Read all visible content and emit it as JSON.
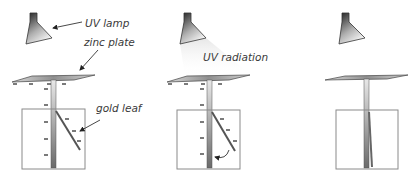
{
  "diagram": {
    "panels": [
      {
        "id": "panel-1",
        "state": "charged",
        "labels": {
          "lamp": "UV lamp",
          "plate": "zinc plate",
          "leaf": "gold leaf"
        },
        "charge_symbol": "-"
      },
      {
        "id": "panel-2",
        "state": "discharging",
        "labels": {
          "radiation": "UV radiation"
        },
        "charge_symbol": "-"
      },
      {
        "id": "panel-3",
        "state": "discharged",
        "labels": {}
      }
    ],
    "colors": {
      "stroke": "#333333",
      "box": "#8a8a8a",
      "gradient_dark": "#2a2a2a",
      "gradient_light": "#f2f2f2",
      "text": "#3a3a3a"
    }
  }
}
